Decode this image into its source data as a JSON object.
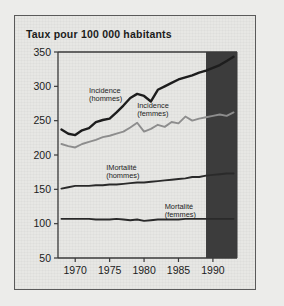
{
  "figure": {
    "title": "Taux pour 100 000 habitants",
    "frame_color": "#5a5a5a",
    "background_color": "#ececea"
  },
  "chart_data": {
    "type": "line",
    "title": "Taux pour 100 000 habitants",
    "xlabel": "",
    "ylabel": "Taux pour 100 000 habitants",
    "xlim": [
      1967.5,
      1993.5
    ],
    "ylim": [
      50,
      350
    ],
    "xticks": [
      1970,
      1975,
      1980,
      1985,
      1990
    ],
    "yticks": [
      50,
      100,
      150,
      200,
      250,
      300,
      350
    ],
    "grid": false,
    "legend": "inline-annotations",
    "annotations": [
      {
        "text": "Incidence\n(hommes)",
        "line1": "Incidence",
        "line2": "(hommes)",
        "x": 1972.0,
        "y": 291
      },
      {
        "text": "Incidence\n(femmes)",
        "line1": "Incidence",
        "line2": "(femmes)",
        "x": 1979.0,
        "y": 268
      },
      {
        "text": "Mortalité\n(hommes)",
        "line1": "IMortalité",
        "line2": "(hommes)",
        "x": 1974.5,
        "y": 178
      },
      {
        "text": "Mortalité\n(femmes)",
        "line1": "Mortalité",
        "line2": "(femmes)",
        "x": 1983.0,
        "y": 122
      }
    ],
    "shaded_region": {
      "label": "projection",
      "x_start": 1989,
      "x_end": 1993.5,
      "color": "#3c3c3c"
    },
    "x": [
      1968,
      1969,
      1970,
      1971,
      1972,
      1973,
      1974,
      1975,
      1976,
      1977,
      1978,
      1979,
      1980,
      1981,
      1982,
      1983,
      1984,
      1985,
      1986,
      1987,
      1988,
      1989,
      1990,
      1991,
      1992,
      1993
    ],
    "series": [
      {
        "name": "Incidence (hommes)",
        "color": "#1d1d1d",
        "width": 2.4,
        "values": [
          237,
          231,
          229,
          236,
          239,
          248,
          251,
          253,
          262,
          272,
          283,
          289,
          286,
          278,
          295,
          300,
          305,
          310,
          313,
          316,
          320,
          323,
          327,
          331,
          337,
          343
        ]
      },
      {
        "name": "Incidence (femmes)",
        "color": "#8d8d8d",
        "width": 1.9,
        "values": [
          216,
          213,
          211,
          216,
          219,
          222,
          226,
          228,
          231,
          234,
          240,
          247,
          234,
          238,
          244,
          241,
          248,
          246,
          256,
          250,
          253,
          255,
          257,
          259,
          257,
          262
        ]
      },
      {
        "name": "Mortalité (hommes)",
        "color": "#2a2a2a",
        "width": 1.9,
        "values": [
          151,
          153,
          155,
          155,
          155,
          156,
          156,
          157,
          157,
          158,
          159,
          160,
          160,
          161,
          162,
          163,
          164,
          165,
          166,
          168,
          168,
          170,
          171,
          172,
          173,
          173
        ]
      },
      {
        "name": "Mortalité (femmes)",
        "color": "#2a2a2a",
        "width": 1.9,
        "values": [
          107,
          107,
          107,
          107,
          107,
          106,
          106,
          106,
          107,
          106,
          105,
          106,
          104,
          105,
          106,
          106,
          106,
          106,
          107,
          107,
          107,
          107,
          107,
          107,
          107,
          107
        ]
      }
    ]
  }
}
